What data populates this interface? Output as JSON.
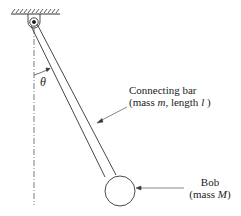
{
  "diagram": {
    "type": "pendulum-schematic",
    "angle_label": "θ",
    "bar_label": {
      "line1": "Connecting bar",
      "line2_prefix": "(mass ",
      "line2_m": "m",
      "line2_mid": ", length ",
      "line2_l": "l",
      "line2_suffix": " )"
    },
    "bob_label": {
      "line1": "Bob",
      "line2_prefix": "(mass ",
      "line2_M": "M",
      "line2_suffix": ")"
    },
    "colors": {
      "stroke": "#333333",
      "text": "#222222",
      "background": "#ffffff"
    }
  }
}
